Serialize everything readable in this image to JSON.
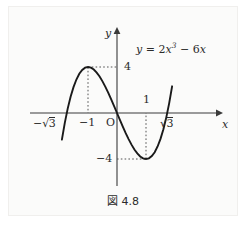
{
  "figure": {
    "caption_prefix": "図",
    "caption_number": "4.8",
    "caption_full": "図 4.8",
    "background_color": "#fbfbfa",
    "ink_color": "#2b2b2b",
    "curve_color": "#1a1a1a"
  },
  "labels": {
    "y_axis": "y",
    "x_axis": "x",
    "origin": "O",
    "tick_neg_sqrt3": "−√3",
    "tick_neg_one": "−1",
    "tick_one": "1",
    "tick_sqrt3": "√3",
    "tick_four": "4",
    "tick_neg_four": "−4",
    "equation": "y = 2x³ − 6x",
    "equation_parts": {
      "lhs": "y",
      "equals": "=",
      "coef_cubic": "2",
      "var": "x",
      "exponent": "3",
      "minus": "−",
      "coef_linear": "6",
      "var2": "x"
    }
  },
  "chart_data": {
    "type": "line",
    "title": "図 4.8",
    "function": "y = 2x^3 - 6x",
    "xlabel": "x",
    "ylabel": "y",
    "xlim": [
      -2.1,
      2.1
    ],
    "ylim": [
      -8.0,
      8.5
    ],
    "grid": false,
    "legend": null,
    "annotations": [
      {
        "text": "y = 2x³ − 6x",
        "x": 1.35,
        "y": 7.2
      }
    ],
    "xticks": [
      -1.732,
      -1,
      0,
      1,
      1.732
    ],
    "xticklabels": [
      "−√3",
      "−1",
      "O",
      "1",
      "√3"
    ],
    "yticks": [
      -4,
      4
    ],
    "yticklabels": [
      "−4",
      "4"
    ],
    "key_points": [
      {
        "name": "root-left",
        "x": -1.732,
        "y": 0,
        "label": "−√3"
      },
      {
        "name": "local-maximum",
        "x": -1,
        "y": 4,
        "label": "4"
      },
      {
        "name": "root-origin",
        "x": 0,
        "y": 0,
        "label": "O"
      },
      {
        "name": "local-minimum",
        "x": 1,
        "y": -4,
        "label": "−4"
      },
      {
        "name": "root-right",
        "x": 1.732,
        "y": 0,
        "label": "√3"
      }
    ],
    "guide_lines": [
      {
        "from": [
          -1,
          4
        ],
        "to": [
          0,
          4
        ],
        "style": "dotted"
      },
      {
        "from": [
          -1,
          4
        ],
        "to": [
          -1,
          0
        ],
        "style": "dotted"
      },
      {
        "from": [
          1,
          -4
        ],
        "to": [
          0,
          -4
        ],
        "style": "dotted"
      },
      {
        "from": [
          1,
          -4
        ],
        "to": [
          1,
          0
        ],
        "style": "dotted"
      }
    ],
    "x": [
      -1.9,
      -1.8,
      -1.7,
      -1.6,
      -1.5,
      -1.4,
      -1.3,
      -1.2,
      -1.1,
      -1.0,
      -0.9,
      -0.8,
      -0.7,
      -0.6,
      -0.5,
      -0.4,
      -0.3,
      -0.2,
      -0.1,
      0.0,
      0.1,
      0.2,
      0.3,
      0.4,
      0.5,
      0.6,
      0.7,
      0.8,
      0.9,
      1.0,
      1.1,
      1.2,
      1.3,
      1.4,
      1.5,
      1.6,
      1.7,
      1.8,
      1.9
    ],
    "y": [
      -2.32,
      -0.86,
      0.38,
      1.41,
      2.25,
      2.91,
      3.41,
      3.74,
      3.94,
      4.0,
      3.94,
      3.78,
      3.51,
      3.17,
      2.75,
      2.27,
      1.75,
      1.18,
      0.6,
      0.0,
      -0.6,
      -1.18,
      -1.75,
      -2.27,
      -2.75,
      -3.17,
      -3.51,
      -3.78,
      -3.94,
      -4.0,
      -3.94,
      -3.74,
      -3.41,
      -2.91,
      -2.25,
      -1.41,
      -0.38,
      0.86,
      2.32
    ]
  }
}
